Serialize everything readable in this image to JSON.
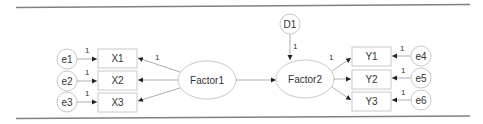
{
  "diagram": {
    "type": "structural-equation-model",
    "latent": {
      "factor1": "Factor1",
      "factor2": "Factor2",
      "disturbance": "D1"
    },
    "indicators_x": [
      "X1",
      "X2",
      "X3"
    ],
    "indicators_y": [
      "Y1",
      "Y2",
      "Y3"
    ],
    "errors_x": [
      "e1",
      "e2",
      "e3"
    ],
    "errors_y": [
      "e4",
      "e5",
      "e6"
    ],
    "path_labels": {
      "e1_x1": "1",
      "e2_x2": "1",
      "e3_x3": "1",
      "factor1_x1": "1",
      "d1_factor2": "1",
      "factor2_y1": "1",
      "e4_y1": "1",
      "e5_y2": "1",
      "e6_y3": "1"
    },
    "colors": {
      "shape_stroke": "#c8c8c8",
      "edge": "#9a9a9a",
      "rule": "#808080",
      "text": "#333333"
    }
  }
}
